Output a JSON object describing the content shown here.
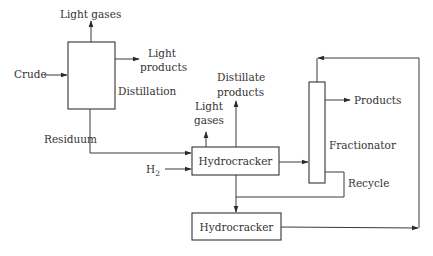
{
  "diagram": {
    "type": "process-flow",
    "colors": {
      "line": "#3a3a3a",
      "text": "#333333",
      "background": "#ffffff"
    },
    "units": {
      "distillation": {
        "label": "Distillation"
      },
      "hydrocracker_1": {
        "label": "Hydrocracker"
      },
      "hydrocracker_2": {
        "label": "Hydrocracker"
      },
      "fractionator": {
        "label": "Fractionator"
      }
    },
    "streams": {
      "crude": "Crude",
      "light_gases_top": "Light gases",
      "light_products_1": "Light",
      "light_products_2": "products",
      "residuum": "Residuum",
      "h2_main": "H",
      "h2_sub": "2",
      "light_gases_hc_1": "Light",
      "light_gases_hc_2": "gases",
      "distillate_1": "Distillate",
      "distillate_2": "products",
      "products": "Products",
      "recycle": "Recycle"
    },
    "connections": [
      {
        "from": "Crude",
        "to": "Distillation"
      },
      {
        "from": "Distillation",
        "to": "Light gases"
      },
      {
        "from": "Distillation",
        "to": "Light products"
      },
      {
        "from": "Distillation",
        "to": "Hydrocracker (1)",
        "via": "Residuum"
      },
      {
        "from": "H2",
        "to": "Hydrocracker (1)"
      },
      {
        "from": "Hydrocracker (1)",
        "to": "Light gases"
      },
      {
        "from": "Hydrocracker (1)",
        "to": "Distillate products"
      },
      {
        "from": "Hydrocracker (1)",
        "to": "Fractionator"
      },
      {
        "from": "Hydrocracker (1)",
        "to": "Hydrocracker (2)"
      },
      {
        "from": "Fractionator",
        "to": "Hydrocracker (2)",
        "via": "Recycle"
      },
      {
        "from": "Fractionator",
        "to": "Products"
      },
      {
        "from": "Hydrocracker (2)",
        "to": "Fractionator",
        "via": "loop to column top"
      }
    ]
  }
}
